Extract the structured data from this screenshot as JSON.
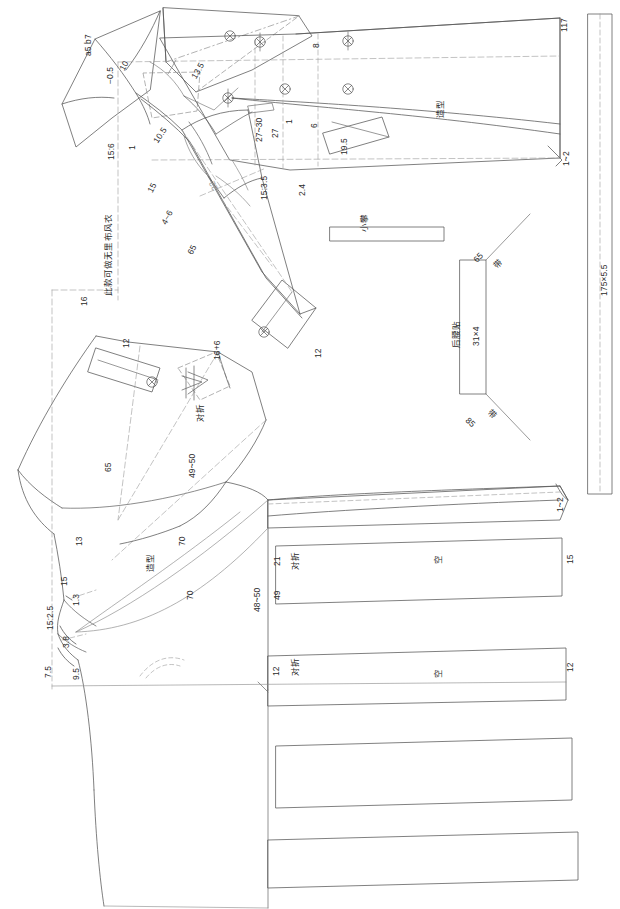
{
  "drawing": {
    "type": "garment-pattern-draft",
    "title": "风衣结构制图",
    "note": "此款可做无里布风衣",
    "line_color": "#555555",
    "construction_color": "#9a9a9a",
    "text_color": "#2b2b2b",
    "background": "#ffffff"
  },
  "pieces": {
    "collar": {
      "name": "领子",
      "ratio_label": "a5 b7"
    },
    "back_waist_facing": {
      "name": "后腰贴",
      "size": "31×4"
    },
    "small_loop": {
      "name": "小攀"
    },
    "belt": {
      "name": "带",
      "size": "175×5.5"
    },
    "sleeve": {
      "name": "袖子"
    },
    "front_body": {
      "name": "前片"
    },
    "back_body": {
      "name": "后片"
    }
  },
  "labels": {
    "collar_ratio": "a5 b7",
    "neg_half": "−0.5",
    "ten": "10",
    "thirteen_five": "13.5",
    "fifteen_six": "15:6",
    "one_a": "1",
    "ten_five": "10.5",
    "fifteen_a": "15",
    "four_six": "4~6",
    "sixty_five_sleeve": "65",
    "twenty_two": "22",
    "fifteen_three_five": "15:3.5",
    "note_text": "此款可做无里布风衣",
    "sixteen": "16",
    "eight": "8",
    "twenty_seven_thirty": "27~30",
    "twenty_seven": "27",
    "one_b": "1",
    "six": "6",
    "nineteen_five": "19.5",
    "two_four": "2.4",
    "style_top": "造型",
    "one_two_top": "1~2",
    "one_one_seven": "117",
    "twelve_cuff": "12",
    "small_loop_label": "小攀",
    "sixty_five_belt": "65",
    "eighty_five_belt": "85",
    "belt_a": "带",
    "belt_b": "带",
    "back_waist_facing_label": "后腰贴",
    "back_waist_facing_size": "31×4",
    "belt_size": "175×5.5",
    "twelve_pocket": "12",
    "sixteen_plus_six": "16+6",
    "fold_pocket": "对折",
    "sixty_five_front": "65",
    "forty_nine_fifty": "49~50",
    "thirteen": "13",
    "fifteen_b": "15",
    "one_three": "1.3",
    "fifteen_two_five": "15:2.5",
    "three_eight": "3.8",
    "seven_five": "7.5",
    "nine_five": "9.5",
    "style_front": "造型",
    "seventy_a": "70",
    "seventy_b": "70",
    "forty_eight_fifty": "48~50",
    "forty_nine": "49",
    "twenty_one": "21",
    "fold_a": "对折",
    "empty_a": "空",
    "fifteen_right": "15",
    "one_two_right": "1~2",
    "twelve_fold": "12",
    "fold_b": "对折",
    "empty_b": "空",
    "twelve_right": "12"
  }
}
